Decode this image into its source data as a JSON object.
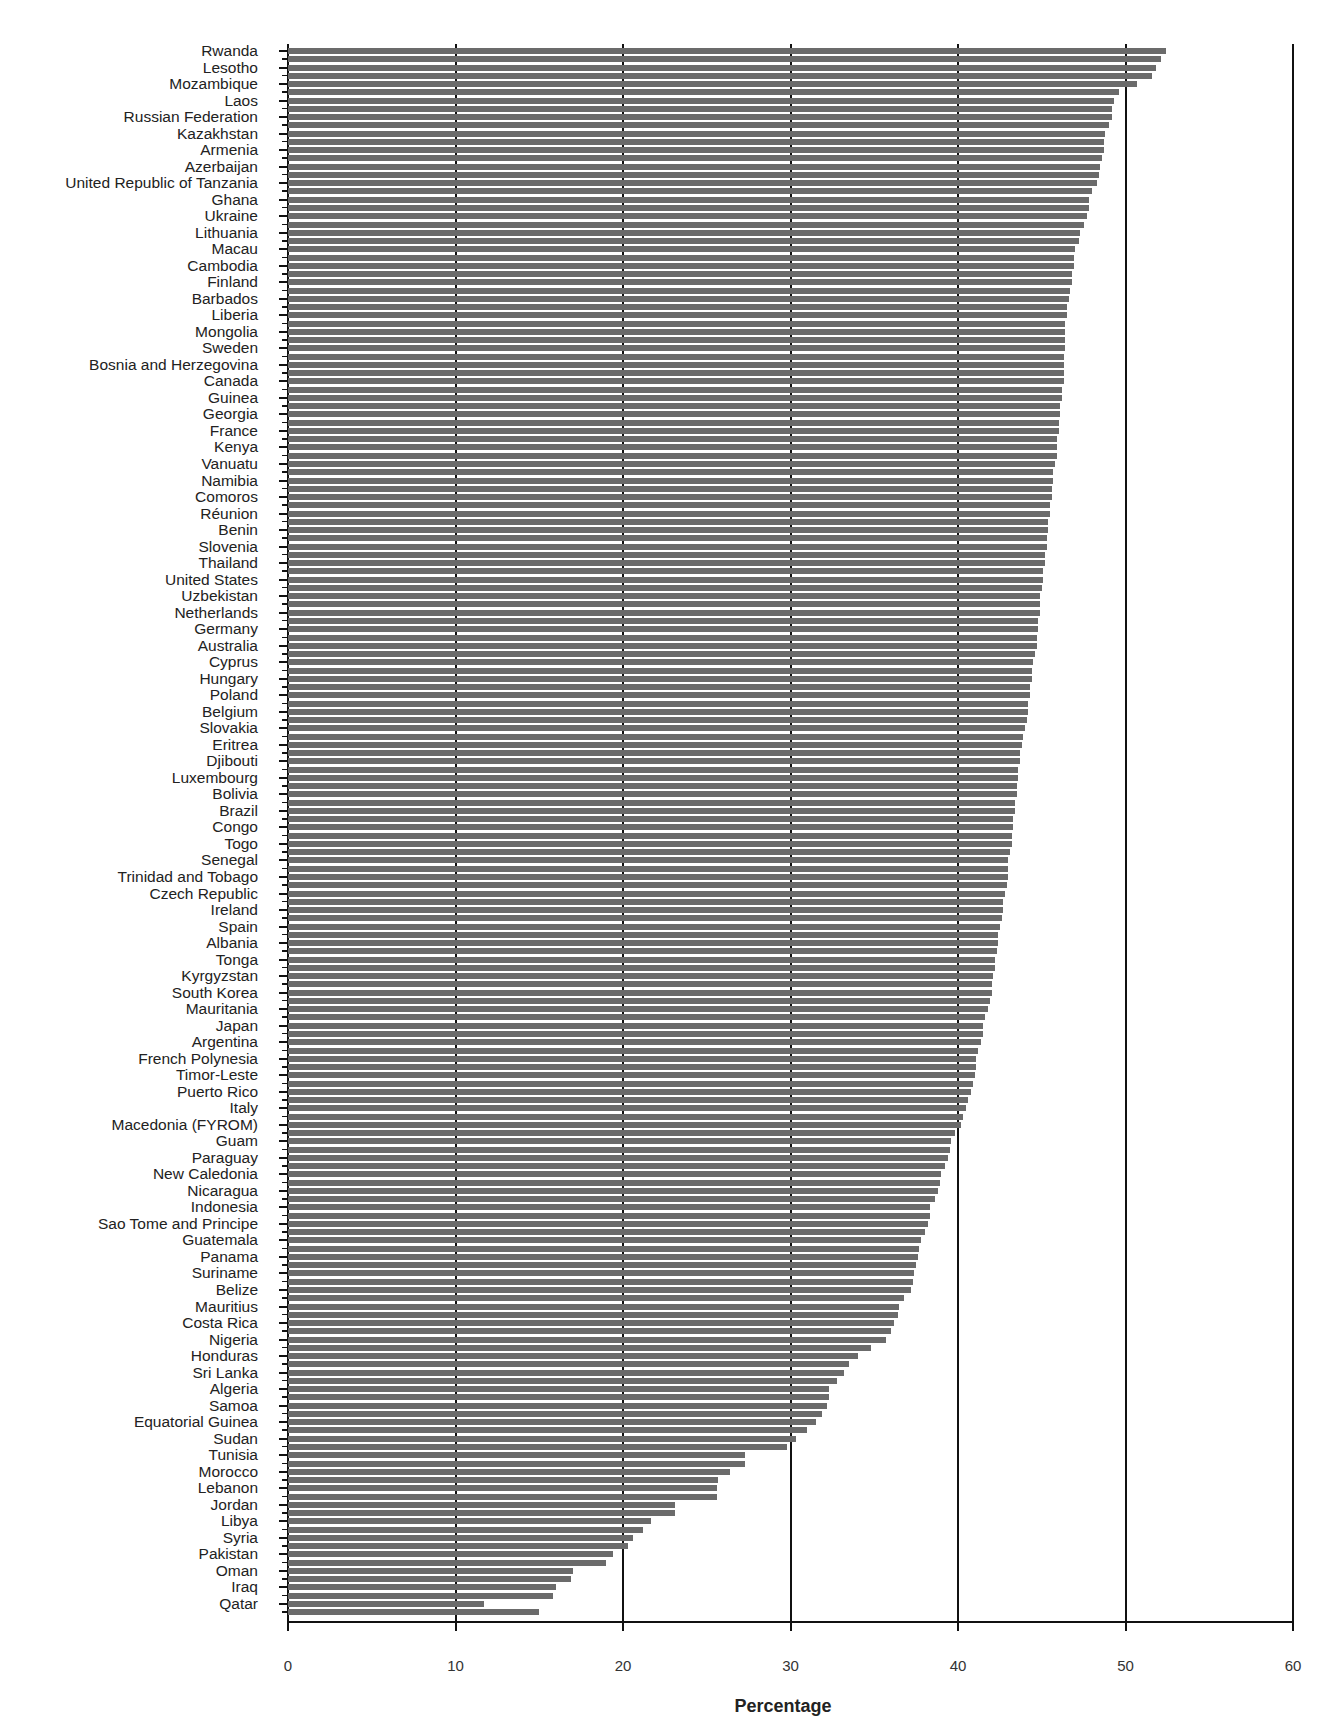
{
  "chart_data": {
    "type": "bar",
    "orientation": "horizontal",
    "title": "",
    "xlabel": "Percentage",
    "ylabel": "",
    "xlim": [
      0,
      60
    ],
    "x_ticks": [
      "0",
      "10",
      "20",
      "30",
      "40",
      "50",
      "60"
    ],
    "grid": "vertical gridlines at 10, 20, 30, 40, 50, 60",
    "note": "Each labeled country row contains two bars; the second bar of each pair belongs to an unlabeled entry (tick only).",
    "bar_color": "#6b6b6b",
    "categories": [
      "Rwanda",
      "Lesotho",
      "Mozambique",
      "Laos",
      "Russian Federation",
      "Kazakhstan",
      "Armenia",
      "Azerbaijan",
      "United Republic of Tanzania",
      "Ghana",
      "Ukraine",
      "Lithuania",
      "Macau",
      "Cambodia",
      "Finland",
      "Barbados",
      "Liberia",
      "Mongolia",
      "Sweden",
      "Bosnia and Herzegovina",
      "Canada",
      "Guinea",
      "Georgia",
      "France",
      "Kenya",
      "Vanuatu",
      "Namibia",
      "Comoros",
      "Réunion",
      "Benin",
      "Slovenia",
      "Thailand",
      "United States",
      "Uzbekistan",
      "Netherlands",
      "Germany",
      "Australia",
      "Cyprus",
      "Hungary",
      "Poland",
      "Belgium",
      "Slovakia",
      "Eritrea",
      "Djibouti",
      "Luxembourg",
      "Bolivia",
      "Brazil",
      "Congo",
      "Togo",
      "Senegal",
      "Trinidad and Tobago",
      "Czech Republic",
      "Ireland",
      "Spain",
      "Albania",
      "Tonga",
      "Kyrgyzstan",
      "South Korea",
      "Mauritania",
      "Japan",
      "Argentina",
      "French Polynesia",
      "Timor-Leste",
      "Puerto Rico",
      "Italy",
      "Macedonia (FYROM)",
      "Guam",
      "Paraguay",
      "New Caledonia",
      "Nicaragua",
      "Indonesia",
      "Sao Tome and Principe",
      "Guatemala",
      "Panama",
      "Suriname",
      "Belize",
      "Mauritius",
      "Costa Rica",
      "Nigeria",
      "Honduras",
      "Sri Lanka",
      "Algeria",
      "Samoa",
      "Equatorial Guinea",
      "Sudan",
      "Tunisia",
      "Morocco",
      "Lebanon",
      "Jordan",
      "Libya",
      "Syria",
      "Pakistan",
      "Oman",
      "Iraq",
      "Qatar"
    ],
    "series": [
      {
        "name": "labeled bar",
        "values": [
          52.4,
          51.8,
          50.7,
          49.3,
          49.2,
          48.8,
          48.7,
          48.5,
          48.3,
          47.8,
          47.7,
          47.3,
          47.0,
          46.9,
          46.8,
          46.6,
          46.5,
          46.4,
          46.4,
          46.3,
          46.3,
          46.2,
          46.1,
          46.0,
          45.9,
          45.8,
          45.7,
          45.6,
          45.5,
          45.4,
          45.3,
          45.2,
          45.1,
          44.9,
          44.9,
          44.8,
          44.7,
          44.5,
          44.4,
          44.3,
          44.2,
          44.0,
          43.8,
          43.7,
          43.6,
          43.5,
          43.4,
          43.3,
          43.2,
          43.0,
          43.0,
          42.8,
          42.7,
          42.5,
          42.4,
          42.2,
          42.1,
          42.0,
          41.8,
          41.5,
          41.4,
          41.1,
          41.0,
          40.8,
          40.5,
          40.2,
          39.6,
          39.4,
          39.0,
          38.8,
          38.3,
          38.2,
          37.8,
          37.6,
          37.4,
          37.2,
          36.5,
          36.2,
          35.7,
          34.0,
          33.2,
          32.3,
          32.2,
          31.5,
          30.3,
          27.3,
          26.4,
          25.6,
          23.1,
          21.7,
          20.6,
          19.4,
          17.0,
          16.0,
          11.7
        ]
      },
      {
        "name": "unlabeled companion bar",
        "values": [
          52.1,
          51.6,
          49.6,
          49.2,
          49.0,
          48.7,
          48.6,
          48.4,
          48.0,
          47.8,
          47.5,
          47.2,
          46.9,
          46.8,
          46.7,
          46.5,
          46.4,
          46.4,
          46.3,
          46.3,
          46.2,
          46.1,
          46.0,
          45.9,
          45.9,
          45.7,
          45.6,
          45.5,
          45.4,
          45.3,
          45.2,
          45.1,
          45.0,
          44.9,
          44.8,
          44.7,
          44.6,
          44.4,
          44.3,
          44.2,
          44.1,
          43.9,
          43.7,
          43.6,
          43.5,
          43.4,
          43.3,
          43.2,
          43.1,
          43.0,
          42.9,
          42.7,
          42.6,
          42.4,
          42.3,
          42.2,
          42.0,
          41.9,
          41.6,
          41.5,
          41.2,
          41.1,
          40.9,
          40.6,
          40.3,
          39.8,
          39.5,
          39.2,
          38.9,
          38.6,
          38.3,
          38.0,
          37.7,
          37.5,
          37.3,
          36.8,
          36.4,
          36.0,
          34.8,
          33.5,
          32.8,
          32.3,
          31.9,
          31.0,
          29.8,
          27.3,
          25.7,
          25.6,
          23.1,
          21.2,
          20.3,
          19.0,
          16.9,
          15.8,
          15.0
        ]
      }
    ]
  },
  "axis": {
    "x_title": "Percentage",
    "tick_labels": [
      "0",
      "10",
      "20",
      "30",
      "40",
      "50",
      "60"
    ]
  }
}
